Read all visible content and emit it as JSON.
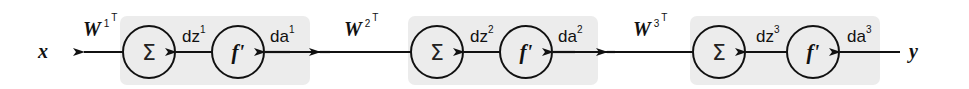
{
  "diagram": {
    "type": "backpropagation-chain",
    "direction": "right-to-left",
    "colors": {
      "box_fill": "#ececec",
      "stroke": "#111111",
      "background": "#ffffff"
    },
    "input_label": "y",
    "output_label": "x",
    "stages": [
      {
        "index": 1,
        "sum_node": "Σ",
        "activation_node": "f'",
        "dz_label": "dz",
        "dz_sup": "1",
        "da_label": "da",
        "da_sup": "1",
        "weight_label": "W",
        "weight_sup": "1",
        "weight_transpose": "T"
      },
      {
        "index": 2,
        "sum_node": "Σ",
        "activation_node": "f'",
        "dz_label": "dz",
        "dz_sup": "2",
        "da_label": "da",
        "da_sup": "2",
        "weight_label": "W",
        "weight_sup": "2",
        "weight_transpose": "T"
      },
      {
        "index": 3,
        "sum_node": "Σ",
        "activation_node": "f'",
        "dz_label": "dz",
        "dz_sup": "3",
        "da_label": "da",
        "da_sup": "3",
        "weight_label": "W",
        "weight_sup": "3",
        "weight_transpose": "T"
      }
    ]
  }
}
